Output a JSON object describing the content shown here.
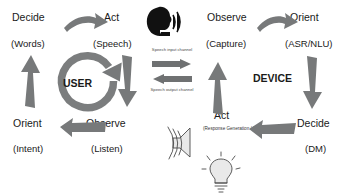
{
  "diagram": {
    "user_loop": {
      "center_label": "USER",
      "nodes": [
        {
          "id": "decide",
          "label": "Decide",
          "sub": "(Words)"
        },
        {
          "id": "act",
          "label": "Act",
          "sub": "(Speech)"
        },
        {
          "id": "observe",
          "label": "Observe",
          "sub": "(Listen)"
        },
        {
          "id": "orient",
          "label": "Orient",
          "sub": "(Intent)"
        }
      ]
    },
    "device_loop": {
      "center_label": "DEVICE",
      "nodes": [
        {
          "id": "observe",
          "label": "Observe",
          "sub": "(Capture)"
        },
        {
          "id": "orient",
          "label": "Orient",
          "sub": "(ASR/NLU)"
        },
        {
          "id": "decide",
          "label": "Decide",
          "sub": "(DM)"
        },
        {
          "id": "act",
          "label": "Act",
          "sub": "(Response Generation / Speech Synthesis)"
        }
      ]
    },
    "channels": [
      {
        "id": "speech-input",
        "label": "Speech input channel",
        "direction": "user-to-device"
      },
      {
        "id": "speech-output",
        "label": "Speech output channel",
        "direction": "device-to-user"
      }
    ],
    "icons": [
      {
        "id": "speaking-head-icon",
        "desc": "head silhouette emitting speech"
      },
      {
        "id": "loudspeaker-icon",
        "desc": "loudspeaker emitting sound"
      },
      {
        "id": "lightbulb-icon",
        "desc": "lightbulb idea"
      }
    ],
    "colors": {
      "arrow": "#77797a",
      "ring": "#7b7d7e",
      "text": "#1a1a1a",
      "icon_dark": "#111111",
      "sketch": "#4b4b4b"
    }
  }
}
